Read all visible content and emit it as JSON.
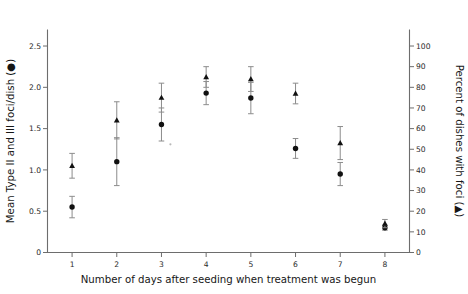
{
  "figure": {
    "background": "#ffffff",
    "marker_color": "#111111",
    "errorbar_color": "#8c8c8c",
    "axis_color": "#6d6d6d"
  },
  "axes": {
    "left": {
      "title": "Mean Type II and III foci/dish (●)",
      "ticks": [
        "0",
        "0.5",
        "1.0",
        "1.5",
        "2.0",
        "2.5"
      ],
      "values": [
        0,
        0.5,
        1.0,
        1.5,
        2.0,
        2.5
      ],
      "min": 0,
      "max": 2.7
    },
    "right": {
      "title": "Percent of dishes with foci (▲)",
      "ticks": [
        "0",
        "10",
        "20",
        "30",
        "40",
        "50",
        "60",
        "70",
        "80",
        "90",
        "100"
      ],
      "values": [
        0,
        10,
        20,
        30,
        40,
        50,
        60,
        70,
        80,
        90,
        100
      ],
      "min": 0,
      "max": 108
    },
    "bottom": {
      "title": "Number of days after seeding when treatment was begun",
      "ticks": [
        "1",
        "2",
        "3",
        "4",
        "5",
        "6",
        "7",
        "8"
      ],
      "values": [
        1,
        2,
        3,
        4,
        5,
        6,
        7,
        8
      ],
      "min": 0.45,
      "max": 8.55
    }
  },
  "chart_data": {
    "type": "scatter",
    "title": "",
    "subtitle": "",
    "xlabel": "Number of days after seeding when treatment was begun",
    "ylabel": "Mean Type II and III foci/dish (●)",
    "y2label": "Percent of dishes with foci (▲)",
    "grid": false,
    "legend": "none",
    "xlim": [
      0.45,
      8.55
    ],
    "ylim": [
      0,
      2.7
    ],
    "y2lim": [
      0,
      108
    ],
    "x": [
      1,
      2,
      3,
      4,
      5,
      6,
      7,
      8
    ],
    "series": [
      {
        "name": "Mean Type II and III foci/dish",
        "marker": "circle",
        "axis": "left",
        "values": [
          0.55,
          1.1,
          1.55,
          1.93,
          1.87,
          1.26,
          0.95,
          0.3
        ],
        "err_low": [
          0.13,
          0.29,
          0.2,
          0.14,
          0.19,
          0.12,
          0.14,
          0.03
        ],
        "err_high": [
          0.13,
          0.29,
          0.2,
          0.14,
          0.19,
          0.12,
          0.14,
          0.03
        ]
      },
      {
        "name": "Percent of dishes with foci",
        "marker": "triangle",
        "axis": "right",
        "values": [
          42,
          64,
          75,
          85,
          84,
          77,
          53,
          14
        ],
        "err_low": [
          6,
          9,
          7,
          5,
          6,
          5,
          8,
          2
        ],
        "err_high": [
          6,
          9,
          7,
          5,
          6,
          5,
          8,
          2
        ]
      }
    ],
    "annotations": [
      {
        "name": "stray-speck",
        "x": 3.2,
        "y_left": 1.31
      }
    ]
  }
}
